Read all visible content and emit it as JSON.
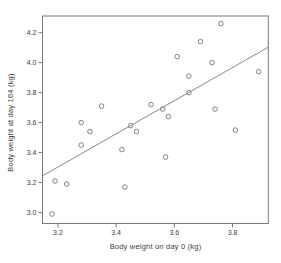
{
  "figure": {
    "background_color": "#ffffff",
    "axis_color": "#7a7a7a",
    "text_color": "#3d3d3d",
    "marker_color": "#757575",
    "trend_line_color": "#7a7a7a"
  },
  "chart_data": {
    "type": "scatter",
    "title": "",
    "xlabel": "Body weight on day 0 (kg)",
    "ylabel": "Body weight at day 164 (kg)",
    "xlim": [
      3.147,
      3.923
    ],
    "ylim": [
      2.927,
      4.311
    ],
    "x_ticks": [
      3.2,
      3.4,
      3.6,
      3.8
    ],
    "y_ticks": [
      3.0,
      3.2,
      3.4,
      3.6,
      3.8,
      4.0,
      4.2
    ],
    "grid": false,
    "legend": false,
    "marker": "open-circle",
    "points": [
      [
        3.18,
        2.99
      ],
      [
        3.19,
        3.21
      ],
      [
        3.23,
        3.19
      ],
      [
        3.28,
        3.45
      ],
      [
        3.28,
        3.6
      ],
      [
        3.31,
        3.54
      ],
      [
        3.35,
        3.71
      ],
      [
        3.42,
        3.42
      ],
      [
        3.43,
        3.17
      ],
      [
        3.45,
        3.58
      ],
      [
        3.47,
        3.54
      ],
      [
        3.52,
        3.72
      ],
      [
        3.56,
        3.69
      ],
      [
        3.57,
        3.37
      ],
      [
        3.58,
        3.64
      ],
      [
        3.61,
        4.04
      ],
      [
        3.65,
        3.8
      ],
      [
        3.65,
        3.91
      ],
      [
        3.69,
        4.14
      ],
      [
        3.73,
        4.0
      ],
      [
        3.74,
        3.69
      ],
      [
        3.76,
        4.26
      ],
      [
        3.81,
        3.55
      ],
      [
        3.89,
        3.94
      ]
    ],
    "trend_line": {
      "x1": 3.147,
      "y1": 3.245,
      "x2": 3.923,
      "y2": 4.103
    }
  }
}
